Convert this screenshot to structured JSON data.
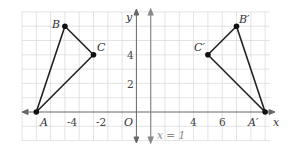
{
  "diagram": {
    "type": "coordinate-plane-reflection",
    "axes": {
      "x_label": "x",
      "y_label": "y",
      "origin_label": "O",
      "x_tick_labels": [
        "-4",
        "-2",
        "4",
        "6"
      ],
      "y_tick_labels": [
        "2",
        "4"
      ]
    },
    "line_of_reflection": {
      "label": "x = 1",
      "x": 1
    },
    "triangle_original": {
      "points": [
        {
          "label": "A",
          "x": -7,
          "y": 0
        },
        {
          "label": "B",
          "x": -5,
          "y": 6
        },
        {
          "label": "C",
          "x": -3,
          "y": 4
        }
      ]
    },
    "triangle_image": {
      "points": [
        {
          "label": "A′",
          "x": 9,
          "y": 0
        },
        {
          "label": "B′",
          "x": 7,
          "y": 6
        },
        {
          "label": "C′",
          "x": 5,
          "y": 4
        }
      ]
    },
    "colors": {
      "grid": "#dcdcdc",
      "axis": "#555555",
      "reflection_line": "#8a8a8a",
      "triangle": "#222222"
    }
  }
}
